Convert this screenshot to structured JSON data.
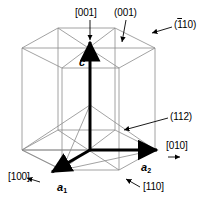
{
  "figure": {
    "kind": "crystal-unit-cell-diagram",
    "lattice": "hexagonal",
    "background_color": "#ffffff",
    "line_color": "#808080",
    "bold_color": "#000000"
  },
  "direction_labels": {
    "c_axis_up": "[001]",
    "a1_direction": "[100]",
    "a2_direction": "[010]",
    "diagonal_direction": "[110]"
  },
  "plane_labels": {
    "basal": "(001)",
    "prismatic_prefix": "(",
    "prismatic_bar": "1",
    "prismatic_rest": "10)",
    "pyramidal": "(112)"
  },
  "vectors": {
    "c": "c",
    "a1_letter": "a",
    "a1_sub": "1",
    "a2_letter": "a",
    "a2_sub": "2"
  }
}
